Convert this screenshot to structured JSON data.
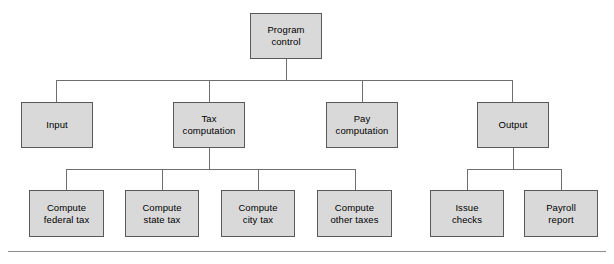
{
  "diagram": {
    "type": "structure-chart",
    "colors": {
      "node_fill": "#d9d9d9",
      "node_border": "#595959",
      "edge": "#6e6e6e",
      "rule": "#8c8c8c",
      "background": "#ffffff",
      "text": "#000000"
    },
    "levels": [
      {
        "level": 0,
        "nodes": [
          {
            "id": "program-control",
            "label": "Program\ncontrol",
            "x": 250,
            "y": 13,
            "w": 72,
            "h": 46
          }
        ]
      },
      {
        "level": 1,
        "nodes": [
          {
            "id": "input",
            "label": "Input",
            "x": 21,
            "y": 102,
            "w": 72,
            "h": 46
          },
          {
            "id": "tax-computation",
            "label": "Tax\ncomputation",
            "x": 173,
            "y": 102,
            "w": 72,
            "h": 46
          },
          {
            "id": "pay-computation",
            "label": "Pay\ncomputation",
            "x": 326,
            "y": 102,
            "w": 72,
            "h": 46
          },
          {
            "id": "output",
            "label": "Output",
            "x": 477,
            "y": 102,
            "w": 72,
            "h": 46
          }
        ]
      },
      {
        "level": 2,
        "nodes": [
          {
            "id": "compute-federal-tax",
            "label": "Compute\nfederal tax",
            "x": 29,
            "y": 190,
            "w": 75,
            "h": 47
          },
          {
            "id": "compute-state-tax",
            "label": "Compute\nstate tax",
            "x": 125,
            "y": 190,
            "w": 74,
            "h": 47
          },
          {
            "id": "compute-city-tax",
            "label": "Compute\ncity tax",
            "x": 221,
            "y": 190,
            "w": 74,
            "h": 47
          },
          {
            "id": "compute-other-taxes",
            "label": "Compute\nother taxes",
            "x": 317,
            "y": 190,
            "w": 75,
            "h": 47
          },
          {
            "id": "issue-checks",
            "label": "Issue\nchecks",
            "x": 430,
            "y": 190,
            "w": 74,
            "h": 47
          },
          {
            "id": "payroll-report",
            "label": "Payroll\nreport",
            "x": 524,
            "y": 190,
            "w": 74,
            "h": 47
          }
        ]
      }
    ],
    "connections": [
      {
        "from": "program-control",
        "to": [
          "input",
          "tax-computation",
          "pay-computation",
          "output"
        ]
      },
      {
        "from": "tax-computation",
        "to": [
          "compute-federal-tax",
          "compute-state-tax",
          "compute-city-tax",
          "compute-other-taxes"
        ]
      },
      {
        "from": "output",
        "to": [
          "issue-checks",
          "payroll-report"
        ]
      }
    ],
    "edges": [
      {
        "id": "root-stem",
        "orient": "v",
        "x": 286,
        "y": 59,
        "len": 22
      },
      {
        "id": "level1-bus",
        "orient": "h",
        "x": 56,
        "y": 80,
        "len": 457
      },
      {
        "id": "drop-input",
        "orient": "v",
        "x": 56,
        "y": 80,
        "len": 22
      },
      {
        "id": "drop-tax",
        "orient": "v",
        "x": 209,
        "y": 80,
        "len": 22
      },
      {
        "id": "drop-pay",
        "orient": "v",
        "x": 362,
        "y": 80,
        "len": 22
      },
      {
        "id": "drop-output",
        "orient": "v",
        "x": 512,
        "y": 80,
        "len": 22
      },
      {
        "id": "tax-stem",
        "orient": "v",
        "x": 209,
        "y": 148,
        "len": 21
      },
      {
        "id": "tax-bus",
        "orient": "h",
        "x": 66,
        "y": 169,
        "len": 289
      },
      {
        "id": "drop-federal",
        "orient": "v",
        "x": 66,
        "y": 169,
        "len": 21
      },
      {
        "id": "drop-state",
        "orient": "v",
        "x": 162,
        "y": 169,
        "len": 21
      },
      {
        "id": "drop-city",
        "orient": "v",
        "x": 258,
        "y": 169,
        "len": 21
      },
      {
        "id": "drop-other",
        "orient": "v",
        "x": 355,
        "y": 169,
        "len": 21
      },
      {
        "id": "output-stem",
        "orient": "v",
        "x": 513,
        "y": 148,
        "len": 21
      },
      {
        "id": "output-bus",
        "orient": "h",
        "x": 467,
        "y": 169,
        "len": 94
      },
      {
        "id": "drop-issue",
        "orient": "v",
        "x": 467,
        "y": 169,
        "len": 21
      },
      {
        "id": "drop-payroll",
        "orient": "v",
        "x": 561,
        "y": 169,
        "len": 21
      }
    ],
    "rules": [
      {
        "id": "bottom-rule",
        "x": 8,
        "y": 251,
        "len": 598
      }
    ]
  }
}
